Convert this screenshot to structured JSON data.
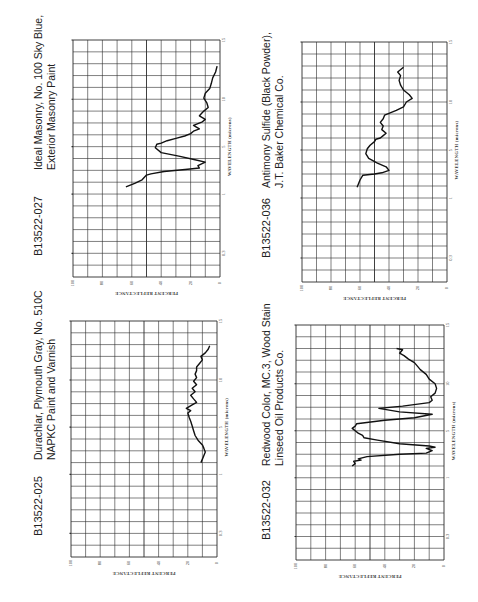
{
  "chart_data": [
    {
      "id": "B13522-027",
      "type": "line",
      "title": "Ideal Masonry, No. 100 Sky Blue, Exterior Masonry Paint",
      "title_lines": [
        "Ideal Masonry, No. 100 Sky Blue,",
        "Exterior Masonry Paint"
      ],
      "xlabel": "PERCENT REFLECTANCE",
      "ylabel": "WAVELENGTH (microns)",
      "x_ticks": [
        "100",
        "80",
        "60",
        "40",
        "20",
        "0"
      ],
      "y_ticks": [
        {
          "label": "0.3",
          "row": 2
        },
        {
          "label": "1",
          "row": 7
        },
        {
          "label": "5",
          "row": 11
        },
        {
          "label": "10",
          "row": 15
        },
        {
          "label": "15",
          "row": 20
        }
      ],
      "xlim": [
        100,
        0
      ],
      "grid": true,
      "orientation": "rotated-90-ccw",
      "points": [
        [
          64,
          7.6
        ],
        [
          58,
          7.9
        ],
        [
          53,
          8.2
        ],
        [
          50,
          8.6
        ],
        [
          47,
          8.7
        ],
        [
          38,
          8.9
        ],
        [
          22,
          9.1
        ],
        [
          14,
          9.2
        ],
        [
          15,
          9.4
        ],
        [
          10,
          9.7
        ],
        [
          17,
          9.9
        ],
        [
          28,
          10.2
        ],
        [
          40,
          10.5
        ],
        [
          44,
          10.9
        ],
        [
          43,
          11.2
        ],
        [
          40,
          11.3
        ],
        [
          36,
          11.5
        ],
        [
          30,
          11.7
        ],
        [
          24,
          11.9
        ],
        [
          20,
          12.1
        ],
        [
          18,
          12.3
        ],
        [
          14,
          12.5
        ],
        [
          18,
          12.8
        ],
        [
          12,
          13.1
        ],
        [
          10,
          13.3
        ],
        [
          14,
          13.6
        ],
        [
          11,
          14.0
        ],
        [
          8,
          14.3
        ],
        [
          9,
          14.7
        ],
        [
          11,
          15.1
        ],
        [
          10,
          15.5
        ],
        [
          7,
          15.9
        ],
        [
          6,
          16.3
        ],
        [
          5,
          16.8
        ],
        [
          3,
          17.3
        ],
        [
          2,
          17.8
        ]
      ]
    },
    {
      "id": "B13522-025",
      "type": "line",
      "title": "Durachlar, Plymouth Gray, No. 510C NAPKC Paint and Varnish",
      "title_lines": [
        "Durachlar, Plymouth Gray, No. 510C",
        "NAPKC Paint and Varnish"
      ],
      "xlabel": "PERCENT REFLECTANCE",
      "ylabel": "WAVELENGTH (microns)",
      "x_ticks": [
        "100",
        "80",
        "60",
        "40",
        "20",
        "0"
      ],
      "y_ticks": [
        {
          "label": "0.3",
          "row": 2
        },
        {
          "label": "1",
          "row": 7
        },
        {
          "label": "5",
          "row": 11
        },
        {
          "label": "10",
          "row": 15
        },
        {
          "label": "15",
          "row": 20
        }
      ],
      "xlim": [
        100,
        0
      ],
      "grid": true,
      "orientation": "rotated-90-ccw",
      "points": [
        [
          11,
          8.0
        ],
        [
          10,
          8.3
        ],
        [
          9,
          8.6
        ],
        [
          8,
          8.9
        ],
        [
          9,
          9.2
        ],
        [
          10,
          9.5
        ],
        [
          13,
          9.9
        ],
        [
          15,
          10.3
        ],
        [
          16,
          10.7
        ],
        [
          17,
          11.1
        ],
        [
          18,
          11.5
        ],
        [
          19,
          11.8
        ],
        [
          20,
          12.2
        ],
        [
          18,
          12.4
        ],
        [
          21,
          12.6
        ],
        [
          17,
          12.9
        ],
        [
          14,
          13.1
        ],
        [
          16,
          13.4
        ],
        [
          18,
          13.7
        ],
        [
          15,
          14.0
        ],
        [
          17,
          14.3
        ],
        [
          14,
          14.6
        ],
        [
          16,
          14.9
        ],
        [
          14,
          15.2
        ],
        [
          15,
          15.5
        ],
        [
          14,
          15.8
        ],
        [
          14,
          16.1
        ],
        [
          12,
          16.4
        ],
        [
          10,
          16.7
        ],
        [
          11,
          17.0
        ],
        [
          8,
          17.3
        ],
        [
          6,
          17.6
        ],
        [
          5,
          17.9
        ]
      ]
    },
    {
      "id": "B13522-036",
      "type": "line",
      "title": "Antimony Sulfide (Black Powder), J.T. Baker Chemical Co.",
      "title_lines": [
        "Antimony Sulfide (Black Powder),",
        "J.T. Baker Chemical Co."
      ],
      "xlabel": "PERCENT REFLECTANCE",
      "ylabel": "WAVELENGTH (microns)",
      "x_ticks": [
        "100",
        "80",
        "60",
        "40",
        "20",
        "0"
      ],
      "y_ticks": [
        {
          "label": "0.3",
          "row": 2
        },
        {
          "label": "1",
          "row": 7
        },
        {
          "label": "5",
          "row": 11
        },
        {
          "label": "10",
          "row": 15
        },
        {
          "label": "15",
          "row": 20
        }
      ],
      "xlim": [
        100,
        0
      ],
      "grid": true,
      "orientation": "rotated-90-ccw",
      "points": [
        [
          62,
          7.9
        ],
        [
          60,
          8.5
        ],
        [
          58,
          8.9
        ],
        [
          50,
          9.0
        ],
        [
          45,
          9.1
        ],
        [
          40,
          9.3
        ],
        [
          42,
          9.6
        ],
        [
          48,
          9.9
        ],
        [
          54,
          10.3
        ],
        [
          56,
          10.7
        ],
        [
          55,
          11.1
        ],
        [
          53,
          11.4
        ],
        [
          50,
          11.7
        ],
        [
          49,
          11.9
        ],
        [
          46,
          12.0
        ],
        [
          44,
          12.2
        ],
        [
          42,
          12.4
        ],
        [
          45,
          12.7
        ],
        [
          44,
          13.0
        ],
        [
          46,
          13.3
        ],
        [
          44,
          13.6
        ],
        [
          43,
          13.9
        ],
        [
          35,
          14.3
        ],
        [
          30,
          14.6
        ],
        [
          28,
          15.0
        ],
        [
          24,
          15.3
        ],
        [
          26,
          15.6
        ],
        [
          30,
          16.0
        ],
        [
          32,
          16.4
        ],
        [
          33,
          16.8
        ],
        [
          32,
          17.2
        ],
        [
          34,
          17.5
        ],
        [
          30,
          17.9
        ]
      ]
    },
    {
      "id": "B13522-032",
      "type": "line",
      "title": "Redwood Color, MC.3, Wood Stain Linseed Oil Products Co.",
      "title_lines": [
        "Redwood Color, MC.3, Wood Stain",
        "Linseed Oil Products Co."
      ],
      "xlabel": "PERCENT REFLECTANCE",
      "ylabel": "WAVELENGTH (microns)",
      "x_ticks": [
        "100",
        "80",
        "60",
        "40",
        "20",
        "0"
      ],
      "y_ticks": [
        {
          "label": "0.3",
          "row": 2
        },
        {
          "label": "1",
          "row": 7
        },
        {
          "label": "5",
          "row": 11
        },
        {
          "label": "10",
          "row": 15
        },
        {
          "label": "15",
          "row": 20
        }
      ],
      "xlim": [
        100,
        0
      ],
      "grid": true,
      "orientation": "rotated-90-ccw",
      "points": [
        [
          62,
          8.0
        ],
        [
          60,
          8.2
        ],
        [
          61,
          8.4
        ],
        [
          56,
          8.5
        ],
        [
          58,
          8.6
        ],
        [
          52,
          8.8
        ],
        [
          30,
          9.0
        ],
        [
          12,
          9.1
        ],
        [
          8,
          9.3
        ],
        [
          12,
          9.5
        ],
        [
          6,
          9.6
        ],
        [
          10,
          9.7
        ],
        [
          30,
          9.9
        ],
        [
          45,
          10.2
        ],
        [
          54,
          10.4
        ],
        [
          55,
          10.6
        ],
        [
          58,
          10.8
        ],
        [
          60,
          11.0
        ],
        [
          62,
          11.2
        ],
        [
          60,
          11.4
        ],
        [
          59,
          11.6
        ],
        [
          40,
          11.9
        ],
        [
          20,
          12.1
        ],
        [
          8,
          12.4
        ],
        [
          30,
          12.6
        ],
        [
          44,
          12.9
        ],
        [
          28,
          13.1
        ],
        [
          10,
          13.4
        ],
        [
          8,
          13.6
        ],
        [
          9,
          13.9
        ],
        [
          6,
          14.2
        ],
        [
          5,
          14.6
        ],
        [
          6,
          15.0
        ],
        [
          10,
          15.4
        ],
        [
          12,
          15.8
        ],
        [
          16,
          16.2
        ],
        [
          18,
          16.5
        ],
        [
          20,
          16.8
        ],
        [
          24,
          17.1
        ],
        [
          27,
          17.4
        ],
        [
          30,
          17.6
        ],
        [
          28,
          17.9
        ],
        [
          32,
          18.0
        ]
      ]
    }
  ],
  "panels": [
    {
      "id": "B13522-027",
      "title_line1": "Ideal Masonry, No. 100 Sky Blue,",
      "title_line2": "Exterior Masonry Paint"
    },
    {
      "id": "B13522-025",
      "title_line1": "Durachlar, Plymouth Gray, No. 510C",
      "title_line2": "NAPKC Paint and Varnish"
    },
    {
      "id": "B13522-036",
      "title_line1": "Antimony Sulfide (Black Powder),",
      "title_line2": "J.T. Baker Chemical Co."
    },
    {
      "id": "B13522-032",
      "title_line1": "Redwood Color, MC.3, Wood Stain",
      "title_line2": "Linseed Oil Products Co."
    }
  ],
  "colors": {
    "grid": "#2b2b2b",
    "curve": "#111111",
    "text": "#222222",
    "background": "#ffffff"
  }
}
